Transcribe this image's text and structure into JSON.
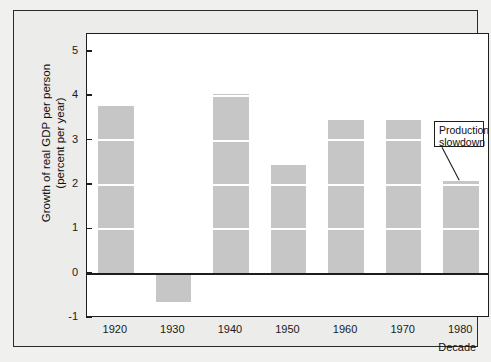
{
  "chart_data": {
    "type": "bar",
    "title": "",
    "xlabel": "Decade",
    "ylabel": "Growth of real GDP per person\n(percent per year)",
    "categories": [
      "1920",
      "1930",
      "1940",
      "1950",
      "1960",
      "1970",
      "1980"
    ],
    "values": [
      3.78,
      -0.65,
      4.05,
      2.45,
      3.47,
      3.47,
      2.08
    ],
    "ylim": [
      -1,
      5.4
    ],
    "yticks": [
      5,
      4,
      3,
      2,
      1,
      0,
      -1
    ],
    "ytick_labels": [
      "5",
      "4",
      "3",
      "2",
      "1",
      "0",
      "-1"
    ],
    "grid": "integer gridlines shown as white gaps across bars",
    "legend": "none",
    "bar_color": "#c6c6c6",
    "annotations": [
      {
        "text": "Production\nslowdown",
        "points_to_category": "1980"
      }
    ]
  },
  "axes": {
    "y_label_line1": "Growth of real GDP per person",
    "y_label_line2": "(percent per year)",
    "x_label": "Decade"
  },
  "colors": {
    "bar": "#c6c6c6",
    "axis": "#1d1d1d",
    "plot_background": "#ffffff",
    "panel_background": "#ececea",
    "figure_background": "#f0f0ee"
  }
}
